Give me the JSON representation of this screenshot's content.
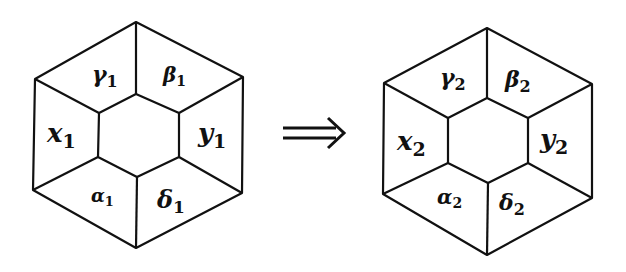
{
  "diagram": {
    "title": "",
    "colors": {
      "stroke": "#111111",
      "background": "#ffffff"
    },
    "left_hexagon": {
      "outer": [
        [
          136,
          22
        ],
        [
          243,
          77
        ],
        [
          242,
          193
        ],
        [
          136,
          248
        ],
        [
          33,
          190
        ],
        [
          35,
          79
        ]
      ],
      "inner": [
        [
          136,
          94
        ],
        [
          179,
          113
        ],
        [
          179,
          157
        ],
        [
          137,
          177
        ],
        [
          98,
          157
        ],
        [
          99,
          113
        ]
      ],
      "regions": [
        {
          "name": "gamma",
          "symbol": "γ",
          "sub": "1",
          "x": 92,
          "y": 82,
          "size": 22
        },
        {
          "name": "beta",
          "symbol": "β",
          "sub": "1",
          "x": 163,
          "y": 82,
          "size": 20
        },
        {
          "name": "x",
          "symbol": "x",
          "sub": "1",
          "x": 47,
          "y": 142,
          "size": 26
        },
        {
          "name": "y",
          "symbol": "y",
          "sub": "1",
          "x": 198,
          "y": 142,
          "size": 26
        },
        {
          "name": "alpha",
          "symbol": "α",
          "sub": "1",
          "x": 91,
          "y": 202,
          "size": 18
        },
        {
          "name": "delta",
          "symbol": "δ",
          "sub": "1",
          "x": 157,
          "y": 208,
          "size": 24
        }
      ]
    },
    "arrow": {
      "symbol": "⟹",
      "x1": 283,
      "x2": 344,
      "y": 133
    },
    "right_hexagon": {
      "outer": [
        [
          487,
          28
        ],
        [
          592,
          84
        ],
        [
          592,
          198
        ],
        [
          487,
          255
        ],
        [
          383,
          194
        ],
        [
          384,
          83
        ]
      ],
      "inner": [
        [
          487,
          98
        ],
        [
          528,
          118
        ],
        [
          528,
          163
        ],
        [
          488,
          183
        ],
        [
          448,
          163
        ],
        [
          448,
          118
        ]
      ],
      "regions": [
        {
          "name": "gamma",
          "symbol": "γ",
          "sub": "2",
          "x": 440,
          "y": 85,
          "size": 22
        },
        {
          "name": "beta",
          "symbol": "β",
          "sub": "2",
          "x": 505,
          "y": 87,
          "size": 22
        },
        {
          "name": "x",
          "symbol": "x",
          "sub": "2",
          "x": 397,
          "y": 150,
          "size": 26
        },
        {
          "name": "y",
          "symbol": "y",
          "sub": "2",
          "x": 540,
          "y": 148,
          "size": 26
        },
        {
          "name": "alpha",
          "symbol": "α",
          "sub": "2",
          "x": 437,
          "y": 204,
          "size": 20
        },
        {
          "name": "delta",
          "symbol": "δ",
          "sub": "2",
          "x": 499,
          "y": 210,
          "size": 22
        }
      ]
    }
  }
}
